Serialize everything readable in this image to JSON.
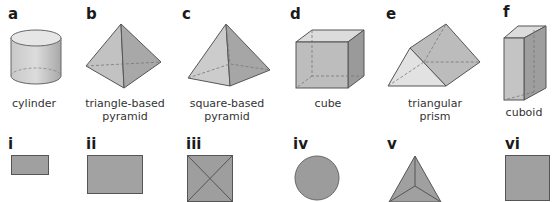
{
  "solids": [
    {
      "letter": "a",
      "name": "cylinder"
    },
    {
      "letter": "b",
      "name_line1": "triangle-based",
      "name_line2": "pyramid"
    },
    {
      "letter": "c",
      "name_line1": "square-based",
      "name_line2": "pyramid"
    },
    {
      "letter": "d",
      "name": "cube"
    },
    {
      "letter": "e",
      "name_line1": "triangular",
      "name_line2": "prism"
    },
    {
      "letter": "f",
      "name": "cuboid"
    }
  ],
  "views": [
    {
      "numeral": "i",
      "shape": "small-rectangle"
    },
    {
      "numeral": "ii",
      "shape": "rectangle"
    },
    {
      "numeral": "iii",
      "shape": "square-with-diagonals"
    },
    {
      "numeral": "iv",
      "shape": "circle"
    },
    {
      "numeral": "v",
      "shape": "triangle-with-center-lines"
    },
    {
      "numeral": "vi",
      "shape": "square"
    }
  ],
  "colors": {
    "fill_light": "#d6d6d6",
    "fill_mid": "#b4b4b4",
    "fill_dark": "#8e8e8e",
    "edge": "#555555",
    "hidden_edge": "#7a7a7a"
  }
}
